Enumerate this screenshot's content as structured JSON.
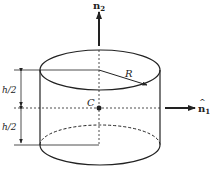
{
  "diagram": {
    "type": "cylinder-geometry",
    "labels": {
      "n2": "n",
      "n2_sub": "2",
      "n1": "n",
      "n1_sub": "1",
      "hat": "^",
      "radius": "R",
      "center": "C",
      "half_height_top": "h/2",
      "half_height_bottom": "h/2"
    },
    "colors": {
      "stroke": "#222222",
      "background": "#ffffff"
    }
  }
}
